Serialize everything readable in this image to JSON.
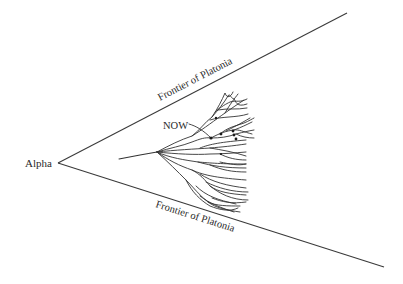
{
  "diagram": {
    "origin_label": "Alpha",
    "upper_frontier_label": "Frontier of Platonia",
    "lower_frontier_label": "Frontier of Platonia",
    "now_label": "NOW",
    "colors": {
      "background": "#ffffff",
      "line": "#333333",
      "text": "#2a2a2a"
    }
  }
}
